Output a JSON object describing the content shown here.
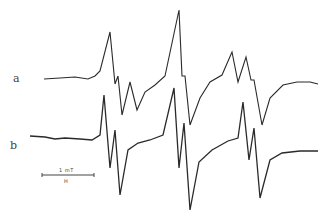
{
  "chart_data": {
    "type": "line",
    "title": "",
    "xlabel": "H",
    "ylabel": "",
    "legend": [],
    "annotations": [
      "a",
      "b",
      "1 mT",
      "H"
    ],
    "scale_bar": {
      "label": "1 mT",
      "axis_label": "H",
      "length_px": 52
    },
    "grid": false,
    "series": [
      {
        "name": "a",
        "points": [
          [
            44,
            79
          ],
          [
            60,
            78
          ],
          [
            75,
            77
          ],
          [
            88,
            79
          ],
          [
            95,
            76
          ],
          [
            100,
            71
          ],
          [
            110,
            32
          ],
          [
            115,
            84
          ],
          [
            118,
            76
          ],
          [
            122,
            115
          ],
          [
            130,
            82
          ],
          [
            137,
            110
          ],
          [
            145,
            92
          ],
          [
            155,
            85
          ],
          [
            165,
            76
          ],
          [
            179,
            10
          ],
          [
            182,
            76
          ],
          [
            185,
            76
          ],
          [
            190,
            125
          ],
          [
            200,
            98
          ],
          [
            210,
            82
          ],
          [
            222,
            75
          ],
          [
            232,
            52
          ],
          [
            238,
            82
          ],
          [
            246,
            57
          ],
          [
            251,
            80
          ],
          [
            254,
            80
          ],
          [
            262,
            125
          ],
          [
            270,
            98
          ],
          [
            283,
            85
          ],
          [
            297,
            82
          ],
          [
            310,
            82
          ],
          [
            318,
            84
          ]
        ]
      },
      {
        "name": "b",
        "points": [
          [
            30,
            136
          ],
          [
            45,
            137
          ],
          [
            55,
            139
          ],
          [
            65,
            138
          ],
          [
            80,
            139
          ],
          [
            92,
            140
          ],
          [
            100,
            135
          ],
          [
            104,
            95
          ],
          [
            110,
            168
          ],
          [
            115,
            130
          ],
          [
            120,
            195
          ],
          [
            128,
            150
          ],
          [
            138,
            143
          ],
          [
            150,
            140
          ],
          [
            163,
            135
          ],
          [
            174,
            88
          ],
          [
            179,
            168
          ],
          [
            184,
            123
          ],
          [
            190,
            210
          ],
          [
            199,
            162
          ],
          [
            212,
            150
          ],
          [
            228,
            141
          ],
          [
            238,
            138
          ],
          [
            243,
            102
          ],
          [
            249,
            160
          ],
          [
            254,
            128
          ],
          [
            260,
            198
          ],
          [
            270,
            160
          ],
          [
            282,
            153
          ],
          [
            300,
            151
          ],
          [
            318,
            151
          ]
        ]
      }
    ]
  },
  "labels": {
    "trace_a": "a",
    "trace_b": "b",
    "scale_value": "1 mT",
    "field_axis": "H"
  }
}
